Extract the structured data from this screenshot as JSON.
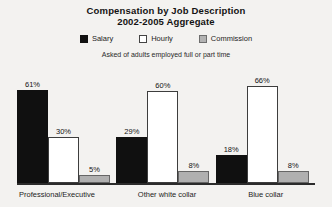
{
  "title": {
    "line1": "Compensation by Job Description",
    "line2": "2002-2005 Aggregate"
  },
  "caption": "Asked of adults employed full or part time",
  "legend": [
    {
      "label": "Salary",
      "swatch": "salary",
      "color": "#101010"
    },
    {
      "label": "Hourly",
      "swatch": "hourly",
      "color": "#ffffff"
    },
    {
      "label": "Commission",
      "swatch": "commission",
      "color": "#b0b0b0"
    }
  ],
  "groups": [
    {
      "category": "Professional/Executive",
      "bars": [
        {
          "series": "Salary",
          "value": 61,
          "label": "61%"
        },
        {
          "series": "Hourly",
          "value": 30,
          "label": "30%"
        },
        {
          "series": "Commission",
          "value": 5,
          "label": "5%"
        }
      ]
    },
    {
      "category": "Other white collar",
      "bars": [
        {
          "series": "Salary",
          "value": 29,
          "label": "29%"
        },
        {
          "series": "Hourly",
          "value": 60,
          "label": "60%"
        },
        {
          "series": "Commission",
          "value": 8,
          "label": "8%"
        }
      ]
    },
    {
      "category": "Blue collar",
      "bars": [
        {
          "series": "Salary",
          "value": 18,
          "label": "18%"
        },
        {
          "series": "Hourly",
          "value": 66,
          "label": "66%"
        },
        {
          "series": "Commission",
          "value": 8,
          "label": "8%"
        }
      ]
    }
  ],
  "chart_data": {
    "type": "bar",
    "title": "Compensation by Job Description 2002-2005 Aggregate",
    "subtitle": "Asked of adults employed full or part time",
    "xlabel": "",
    "ylabel": "",
    "ylim": [
      0,
      70
    ],
    "grid": false,
    "legend_position": "top-center",
    "value_format": "percent",
    "categories": [
      "Professional/Executive",
      "Other white collar",
      "Blue collar"
    ],
    "series": [
      {
        "name": "Salary",
        "color": "#101010",
        "values": [
          61,
          30,
          18
        ]
      },
      {
        "name": "Hourly",
        "color": "#ffffff",
        "values": [
          30,
          60,
          66
        ]
      },
      {
        "name": "Commission",
        "color": "#b0b0b0",
        "values": [
          5,
          8,
          8
        ]
      }
    ],
    "data_labels": [
      [
        "61%",
        "30%",
        "5%"
      ],
      [
        "29%",
        "60%",
        "8%"
      ],
      [
        "18%",
        "66%",
        "8%"
      ]
    ],
    "note": "Salary values per category: Professional/Executive 61, Other white collar 29, Blue collar 18. Hourly: 30, 60, 66. Commission: 5, 8, 8."
  }
}
